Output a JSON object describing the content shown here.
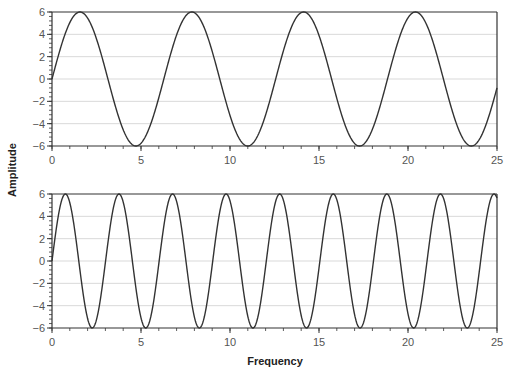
{
  "figure": {
    "ylabel": "Amplitude",
    "xlabel": "Frequency"
  },
  "colors": {
    "line": "#333333",
    "axis": "#333333",
    "grid": "#d9d9d9",
    "text": "#555555",
    "label": "#222222"
  },
  "chart_data": [
    {
      "type": "line",
      "title": "",
      "xlabel": "",
      "ylabel": "Amplitude",
      "xlim": [
        0,
        25
      ],
      "ylim": [
        -6,
        6
      ],
      "xticks": [
        0,
        5,
        10,
        15,
        20,
        25
      ],
      "yticks": [
        -6,
        -4,
        -2,
        0,
        2,
        4,
        6
      ],
      "x_minor_step": 1,
      "y_minor_step": 0.4,
      "grid": "horizontal at major y ticks",
      "series": [
        {
          "name": "signal",
          "function": "6*sin(x)",
          "amplitude": 6,
          "period": 6.283,
          "peaks_x": [
            1.57,
            7.85,
            14.14,
            20.42
          ],
          "troughs_x": [
            4.71,
            11.0,
            17.28,
            23.56
          ]
        }
      ]
    },
    {
      "type": "line",
      "title": "",
      "xlabel": "Frequency",
      "ylabel": "Amplitude",
      "xlim": [
        0,
        25
      ],
      "ylim": [
        -6,
        6
      ],
      "xticks": [
        0,
        5,
        10,
        15,
        20,
        25
      ],
      "yticks": [
        -6,
        -4,
        -2,
        0,
        2,
        4,
        6
      ],
      "x_minor_step": 1,
      "y_minor_step": 0.4,
      "grid": "horizontal at major y ticks",
      "series": [
        {
          "name": "signal",
          "function": "6*sin(2.086*x)",
          "amplitude": 6,
          "period": 3.01,
          "peaks_x": [
            0.9,
            3.9,
            6.9,
            9.9,
            13.0,
            16.0,
            19.0,
            22.0,
            25.0
          ],
          "troughs_x": [
            2.4,
            5.4,
            8.4,
            11.5,
            14.5,
            17.5,
            20.5,
            23.5
          ]
        }
      ]
    }
  ]
}
